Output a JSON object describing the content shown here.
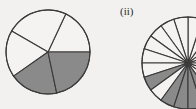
{
  "figure": {
    "background_color": "#f2f1ef",
    "width": 196,
    "height": 109,
    "panel_labels": {
      "panel_ii": "(ii)"
    }
  },
  "style": {
    "stroke_color": "#3a3a3a",
    "fill_shaded": "#8a8a8a",
    "fill_unshaded": "#f4f3f1",
    "stroke_width": 1.1
  },
  "chart_data": [
    {
      "type": "pie",
      "name": "pie-left",
      "title": "",
      "subtitle": "",
      "xlabel": "",
      "ylabel": "",
      "legend_position": "none",
      "grid": false,
      "center": [
        48,
        52
      ],
      "radius": 42,
      "equal_sectors": false,
      "sector_count": 5,
      "categories": [
        "s1",
        "s2",
        "s3",
        "s4",
        "s5"
      ],
      "values": [
        18,
        24,
        18,
        19,
        21
      ],
      "start_angles_deg": [
        0,
        65,
        150,
        215,
        282
      ],
      "end_angles_deg": [
        65,
        150,
        215,
        282,
        360
      ],
      "shaded": [
        false,
        false,
        false,
        true,
        true
      ],
      "annotations": []
    },
    {
      "type": "pie",
      "name": "pie-right",
      "title": "",
      "subtitle": "",
      "xlabel": "",
      "ylabel": "",
      "legend_position": "none",
      "grid": false,
      "center": [
        188,
        63
      ],
      "radius": 46,
      "equal_sectors": true,
      "sector_count": 20,
      "sector_angle_deg": 18,
      "categories": [
        "s1",
        "s2",
        "s3",
        "s4",
        "s5",
        "s6",
        "s7",
        "s8",
        "s9",
        "s10",
        "s11",
        "s12",
        "s13",
        "s14",
        "s15",
        "s16",
        "s17",
        "s18",
        "s19",
        "s20"
      ],
      "values": [
        5,
        5,
        5,
        5,
        5,
        5,
        5,
        5,
        5,
        5,
        5,
        5,
        5,
        5,
        5,
        5,
        5,
        5,
        5,
        5
      ],
      "shaded": [
        false,
        false,
        false,
        false,
        false,
        false,
        false,
        false,
        false,
        false,
        false,
        true,
        false,
        true,
        true,
        true,
        true,
        false,
        false,
        false
      ],
      "clipped_by_frame": true,
      "annotations": [
        "(ii)"
      ]
    }
  ]
}
